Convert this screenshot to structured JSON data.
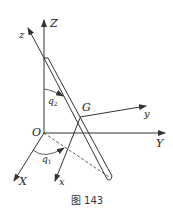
{
  "figure": {
    "caption": "图 143",
    "labels": {
      "Z": "Z",
      "z": "z",
      "Y": "Y",
      "y": "y",
      "X": "X",
      "x": "x",
      "O": "O",
      "G": "G",
      "q1": "q",
      "q1_sub": "1",
      "q2": "q",
      "q2_sub": "2"
    },
    "colors": {
      "line": "#333333",
      "background": "#ffffff"
    }
  }
}
